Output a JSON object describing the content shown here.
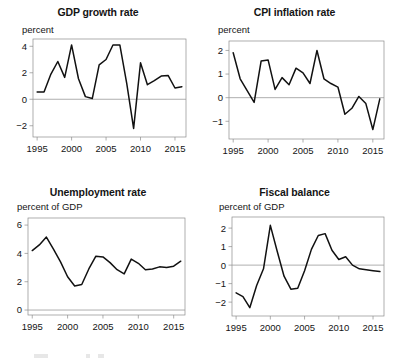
{
  "figure": {
    "layout": "2x2-grid",
    "background_color": "#ffffff",
    "line_color": "#111111",
    "axis_color": "#8c8c8c",
    "zero_line_color": "#9a9a9a"
  },
  "chart_data": [
    {
      "type": "line",
      "title": "GDP growth rate",
      "ylabel": "percent",
      "xlabel": "",
      "grid": false,
      "legend": null,
      "xlim": [
        1994.4,
        2016.6
      ],
      "ylim": [
        -2.85,
        4.55
      ],
      "yticks": [
        -2,
        0,
        2,
        4
      ],
      "ytick_labels": [
        "−2",
        "0",
        "2",
        "4"
      ],
      "xticks": [
        1995,
        2000,
        2005,
        2010,
        2015
      ],
      "xtick_labels": [
        "1995",
        "2000",
        "2005",
        "2010",
        "2015"
      ],
      "zero_line": 0,
      "x": [
        1995,
        1996,
        1997,
        1998,
        1999,
        2000,
        2001,
        2002,
        2003,
        2004,
        2005,
        2006,
        2007,
        2008,
        2009,
        2010,
        2011,
        2012,
        2013,
        2014,
        2015,
        2016
      ],
      "values": [
        0.55,
        0.55,
        1.9,
        2.85,
        1.65,
        4.1,
        1.55,
        0.2,
        0.05,
        2.6,
        3.0,
        4.1,
        4.1,
        1.2,
        -2.2,
        2.75,
        1.1,
        1.4,
        1.75,
        1.8,
        0.85,
        0.95
      ]
    },
    {
      "type": "line",
      "title": "CPI inflation rate",
      "ylabel": "percent",
      "xlabel": "",
      "grid": false,
      "legend": null,
      "xlim": [
        1994.4,
        2016.6
      ],
      "ylim": [
        -1.75,
        2.4
      ],
      "yticks": [
        -1,
        0,
        1,
        2
      ],
      "ytick_labels": [
        "−1",
        "0",
        "1",
        "2"
      ],
      "xticks": [
        1995,
        2000,
        2005,
        2010,
        2015
      ],
      "xtick_labels": [
        "1995",
        "2000",
        "2005",
        "2010",
        "2015"
      ],
      "zero_line": 0,
      "x": [
        1995,
        1996,
        1997,
        1998,
        1999,
        2000,
        2001,
        2002,
        2003,
        2004,
        2005,
        2006,
        2007,
        2008,
        2009,
        2010,
        2011,
        2012,
        2013,
        2014,
        2015,
        2016
      ],
      "values": [
        1.9,
        0.8,
        0.3,
        -0.2,
        1.55,
        1.6,
        0.35,
        0.85,
        0.55,
        1.25,
        1.05,
        0.6,
        2.0,
        0.8,
        0.6,
        0.45,
        -0.7,
        -0.45,
        0.05,
        -0.25,
        -1.35,
        -0.05
      ]
    },
    {
      "type": "line",
      "title": "Unemployment rate",
      "ylabel": "percent of GDP",
      "xlabel": "",
      "grid": false,
      "legend": null,
      "xlim": [
        1994.4,
        2016.6
      ],
      "ylim": [
        -0.35,
        6.5
      ],
      "yticks": [
        0,
        2,
        4,
        6
      ],
      "ytick_labels": [
        "0",
        "2",
        "4",
        "6"
      ],
      "xticks": [
        1995,
        2000,
        2005,
        2010,
        2015
      ],
      "xtick_labels": [
        "1995",
        "2000",
        "2005",
        "2010",
        "2015"
      ],
      "zero_line": 0,
      "x": [
        1995,
        1996,
        1997,
        1998,
        1999,
        2000,
        2001,
        2002,
        2003,
        2004,
        2005,
        2006,
        2007,
        2008,
        2009,
        2010,
        2011,
        2012,
        2013,
        2014,
        2015,
        2016
      ],
      "values": [
        4.2,
        4.6,
        5.15,
        4.3,
        3.4,
        2.35,
        1.7,
        1.8,
        2.9,
        3.8,
        3.75,
        3.35,
        2.85,
        2.55,
        3.6,
        3.3,
        2.85,
        2.9,
        3.05,
        3.0,
        3.1,
        3.45
      ]
    },
    {
      "type": "line",
      "title": "Fiscal balance",
      "ylabel": "percent of GDP",
      "xlabel": "",
      "grid": false,
      "legend": null,
      "xlim": [
        1994.4,
        2016.6
      ],
      "ylim": [
        -2.75,
        2.6
      ],
      "yticks": [
        -2,
        -1,
        0,
        1,
        2
      ],
      "ytick_labels": [
        "−2",
        "−1",
        "0",
        "1",
        "2"
      ],
      "xticks": [
        1995,
        2000,
        2005,
        2010,
        2015
      ],
      "xtick_labels": [
        "1995",
        "2000",
        "2005",
        "2010",
        "2015"
      ],
      "zero_line": 0,
      "x": [
        1995,
        1996,
        1997,
        1998,
        1999,
        2000,
        2001,
        2002,
        2003,
        2004,
        2005,
        2006,
        2007,
        2008,
        2009,
        2010,
        2011,
        2012,
        2013,
        2014,
        2015,
        2016
      ],
      "values": [
        -1.5,
        -1.7,
        -2.3,
        -1.1,
        -0.2,
        2.15,
        0.75,
        -0.6,
        -1.3,
        -1.25,
        -0.3,
        0.85,
        1.6,
        1.7,
        0.8,
        0.3,
        0.45,
        0.0,
        -0.2,
        -0.25,
        -0.3,
        -0.35
      ]
    }
  ]
}
